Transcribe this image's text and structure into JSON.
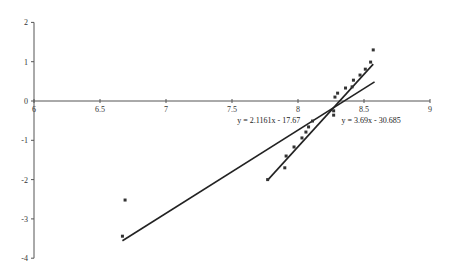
{
  "chart_data": {
    "type": "scatter",
    "title": "",
    "xlabel": "",
    "ylabel": "",
    "xlim": [
      6,
      9
    ],
    "ylim": [
      -4,
      2
    ],
    "grid": false,
    "legend": "none",
    "x_ticks": [
      "6",
      "6.5",
      "7",
      "7.5",
      "8",
      "8.5",
      "9"
    ],
    "y_ticks": [
      "2",
      "1",
      "0",
      "-1",
      "-2",
      "-3",
      "-4"
    ],
    "series": [
      {
        "name": "data",
        "marker": "square",
        "x": [
          6.69,
          6.67,
          7.77,
          7.9,
          7.91,
          7.97,
          8.03,
          8.06,
          8.08,
          8.11,
          8.27,
          8.27,
          8.28,
          8.3,
          8.36,
          8.41,
          8.42,
          8.47,
          8.51,
          8.55,
          8.57
        ],
        "y": [
          -2.52,
          -3.44,
          -2.0,
          -1.7,
          -1.4,
          -1.17,
          -0.94,
          -0.79,
          -0.66,
          -0.51,
          -0.36,
          -0.25,
          0.1,
          0.2,
          0.33,
          0.36,
          0.53,
          0.66,
          0.81,
          0.99,
          1.3
        ]
      }
    ],
    "trendlines": [
      {
        "equation": "y = 2.1161x - 17.67",
        "slope": 2.1161,
        "intercept": -17.67,
        "x_range": [
          6.67,
          8.58
        ]
      },
      {
        "equation": "y = 3.69x - 30.685",
        "slope": 3.69,
        "intercept": -30.685,
        "x_range": [
          7.77,
          8.57
        ]
      }
    ],
    "annotations": [
      {
        "text": "y = 2.1161x - 17.67",
        "x": 7.54,
        "y": -0.55
      },
      {
        "text": "y = 3.69x - 30.685",
        "x": 8.33,
        "y": -0.55
      }
    ]
  }
}
